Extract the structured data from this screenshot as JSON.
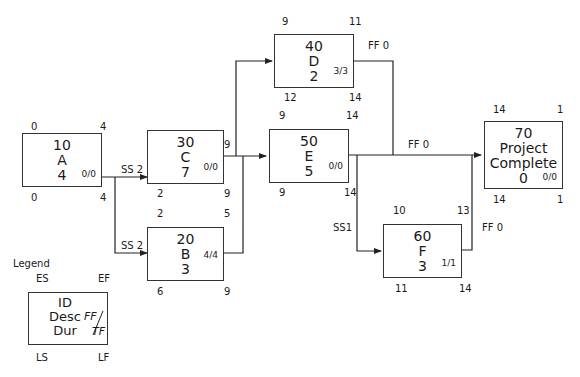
{
  "diagram": {
    "type": "precedence-network",
    "nodes": [
      {
        "key": "A",
        "id": "10",
        "desc": "A",
        "dur": "4",
        "ff_tf": "0/0",
        "es": "0",
        "ef": "4",
        "ls": "0",
        "lf": "4"
      },
      {
        "key": "C",
        "id": "30",
        "desc": "C",
        "dur": "7",
        "ff_tf": "0/0",
        "es": "2",
        "ef": "9",
        "ls": "2",
        "lf": "9"
      },
      {
        "key": "B",
        "id": "20",
        "desc": "B",
        "dur": "3",
        "ff_tf": "4/4",
        "es": "2",
        "ef": "5",
        "ls": "6",
        "lf": "9"
      },
      {
        "key": "D",
        "id": "40",
        "desc": "D",
        "dur": "2",
        "ff_tf": "3/3",
        "es": "9",
        "ef": "11",
        "ls": "12",
        "lf": "14"
      },
      {
        "key": "E",
        "id": "50",
        "desc": "E",
        "dur": "5",
        "ff_tf": "0/0",
        "es": "9",
        "ef": "14",
        "ls": "9",
        "lf": "14"
      },
      {
        "key": "F",
        "id": "60",
        "desc": "F",
        "dur": "3",
        "ff_tf": "1/1",
        "es": "10",
        "ef": "13",
        "ls": "11",
        "lf": "14"
      },
      {
        "key": "PC",
        "id": "70",
        "desc_line1": "Project",
        "desc_line2": "Complete",
        "dur": "0",
        "ff_tf": "0/0",
        "es": "14",
        "ef": "1",
        "ls": "14",
        "lf": "1"
      }
    ],
    "links": [
      {
        "from": "A",
        "to": "C",
        "label": "SS 2"
      },
      {
        "from": "A",
        "to": "B",
        "label": "SS 2"
      },
      {
        "from": "C",
        "to": "D",
        "label": ""
      },
      {
        "from": "C",
        "to": "E",
        "label": ""
      },
      {
        "from": "B",
        "to": "E",
        "label": ""
      },
      {
        "from": "D",
        "to": "PC",
        "label": "FF 0"
      },
      {
        "from": "E",
        "to": "PC",
        "label": "FF 0"
      },
      {
        "from": "E",
        "to": "F",
        "label": "SS1"
      },
      {
        "from": "F",
        "to": "PC",
        "label": "FF 0"
      }
    ],
    "legend": {
      "title": "Legend",
      "es": "ES",
      "ef": "EF",
      "ls": "LS",
      "lf": "LF",
      "id": "ID",
      "desc": "Desc",
      "dur": "Dur",
      "ff": "FF",
      "tf": "TF"
    },
    "colors": {
      "line": "#222222",
      "box_border": "#333333",
      "background": "#ffffff"
    }
  }
}
